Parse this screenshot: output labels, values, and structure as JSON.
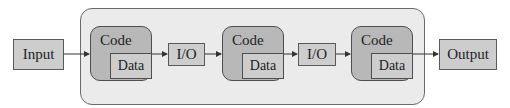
{
  "diagram": {
    "input": {
      "label": "Input"
    },
    "output": {
      "label": "Output"
    },
    "stages": [
      {
        "code_label": "Code",
        "data_label": "Data"
      },
      {
        "code_label": "Code",
        "data_label": "Data"
      },
      {
        "code_label": "Code",
        "data_label": "Data"
      }
    ],
    "io": [
      {
        "label": "I/O"
      },
      {
        "label": "I/O"
      }
    ],
    "colors": {
      "container_fill": "#ebebeb",
      "code_fill": "#b8b8b8",
      "box_fill": "#cdcdcd",
      "stroke": "#4e4e4e"
    }
  }
}
